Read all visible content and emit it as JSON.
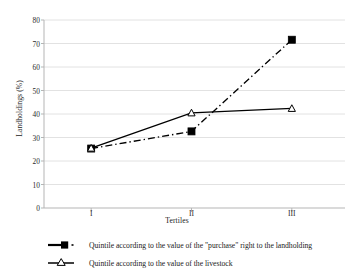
{
  "chart_data": {
    "type": "line",
    "title": "",
    "xlabel": "Tertiles",
    "ylabel": "Landholdings (%)",
    "categories": [
      "I",
      "II",
      "III"
    ],
    "ylim": [
      0,
      80
    ],
    "yticks": [
      0,
      10,
      20,
      30,
      40,
      50,
      60,
      70,
      80
    ],
    "ytick_labels": [
      "0",
      "10",
      "20",
      "30",
      "40",
      "50",
      "60",
      "70",
      "80"
    ],
    "grid": "horizontal",
    "legend_position": "below-axis-left",
    "series": [
      {
        "name": "Quintile according to the value of the \"purchase\" right to the landholding",
        "values": [
          25.3,
          32.6,
          71.6
        ],
        "marker": "filled-square",
        "linestyle": "dash-dot",
        "color": "#000000"
      },
      {
        "name": "Quintile according to the value of the livestock",
        "values": [
          25.5,
          40.5,
          42.4
        ],
        "marker": "open-triangle",
        "linestyle": "solid",
        "color": "#000000"
      }
    ]
  },
  "axes": {
    "y_title": "Landholdings (%)",
    "x_title": "Tertiles",
    "y_tick_labels": [
      "80",
      "70",
      "60",
      "50",
      "40",
      "30",
      "20",
      "10",
      "0"
    ],
    "x_tick_labels": [
      "I",
      "II",
      "III"
    ]
  },
  "legend": {
    "entries": [
      {
        "label": "Quintile according to the value of the \"purchase\" right to the landholding"
      },
      {
        "label": "Quintile according to the value of the livestock"
      }
    ]
  },
  "colors": {
    "series": "#000000",
    "gridline": "#e2e2e2",
    "axis": "#b5b5b5",
    "background": "#ffffff",
    "text": "#1a1a1a"
  }
}
